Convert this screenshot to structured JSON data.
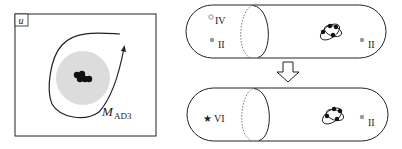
{
  "left_panel": {
    "corner_label": "u",
    "trajectory_label_main": "M",
    "trajectory_label_sub": "AD3"
  },
  "top_capsule": {
    "markers": [
      {
        "type": "open-circle",
        "label": "IV"
      },
      {
        "type": "gray-dot",
        "label": "II"
      },
      {
        "type": "gray-dot",
        "label": "II"
      }
    ]
  },
  "bottom_capsule": {
    "markers": [
      {
        "type": "star",
        "symbol": "★",
        "label": "VI"
      },
      {
        "type": "gray-dot",
        "label": "II"
      }
    ]
  },
  "colors": {
    "stroke": "#222222",
    "fill_disc": "#dcdcdc",
    "gray_dot": "#999999",
    "cluster_dot": "#111111"
  }
}
